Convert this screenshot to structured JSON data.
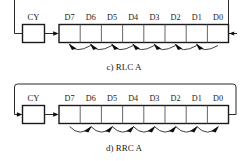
{
  "figure": {
    "bit_labels": [
      "D7",
      "D6",
      "D5",
      "D4",
      "D3",
      "D2",
      "D1",
      "D0"
    ],
    "carry_label": "CY"
  },
  "diagrams": [
    {
      "id": "rlc",
      "caption": "c) RLC A",
      "operation": "RLC A",
      "part_letter": "c)",
      "direction": "left",
      "carry_label": "CY",
      "bit_labels": [
        "D7",
        "D6",
        "D5",
        "D4",
        "D3",
        "D2",
        "D1",
        "D0"
      ],
      "feedback": "register-right-to-carry-left",
      "shift_arrow_direction": "left"
    },
    {
      "id": "rrc",
      "caption": "d) RRC A",
      "operation": "RRC A",
      "part_letter": "d)",
      "direction": "right",
      "carry_label": "CY",
      "bit_labels": [
        "D7",
        "D6",
        "D5",
        "D4",
        "D3",
        "D2",
        "D1",
        "D0"
      ],
      "feedback": "register-right-over-top-to-carry-left",
      "shift_arrow_direction": "right"
    }
  ],
  "colors": {
    "ink": "#1a1a1a",
    "wire": "#2b2b2b",
    "paper": "#ffffff"
  }
}
